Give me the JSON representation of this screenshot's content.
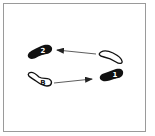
{
  "diagram": {
    "type": "footwork-step-diagram",
    "colors": {
      "frame_border": "#9a9a9a",
      "filled_foot": "#111111",
      "outline_foot_stroke": "#111111",
      "outline_foot_fill": "#ffffff",
      "arrow": "#333333",
      "label_on_filled": "#ffffff",
      "label_on_outline": "#111111"
    },
    "feet": [
      {
        "id": "foot-2",
        "label": "2",
        "style": "filled",
        "position": "upper-left"
      },
      {
        "id": "foot-b",
        "label": "B",
        "style": "outline",
        "position": "lower-left"
      },
      {
        "id": "foot-start-right",
        "label": "",
        "style": "outline",
        "position": "upper-right"
      },
      {
        "id": "foot-1",
        "label": "1",
        "style": "filled",
        "position": "lower-right"
      }
    ],
    "arrows": [
      {
        "id": "arrow-b-to-1",
        "from": "B",
        "to": "1",
        "direction": "right"
      },
      {
        "id": "arrow-to-2",
        "from": "upper-right outline foot",
        "to": "2",
        "direction": "left"
      }
    ]
  }
}
